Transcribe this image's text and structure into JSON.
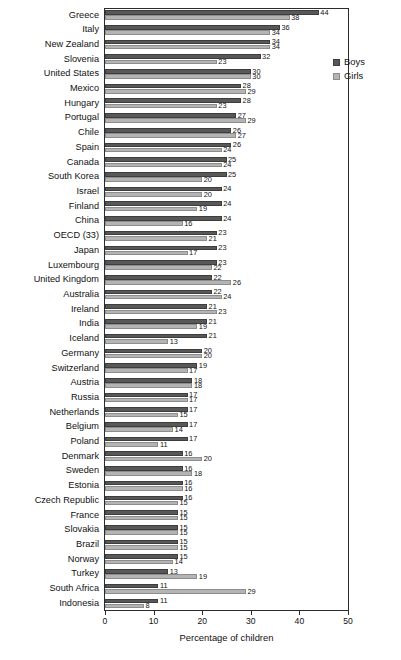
{
  "chart_data": {
    "type": "bar",
    "orientation": "horizontal",
    "title": "",
    "xlabel": "Percentage of children",
    "ylabel": "",
    "xlim": [
      0,
      50
    ],
    "xticks": [
      0,
      10,
      20,
      30,
      40,
      50
    ],
    "grid": false,
    "legend_position": "top-right",
    "categories": [
      "Greece",
      "Italy",
      "New Zealand",
      "Slovenia",
      "United States",
      "Mexico",
      "Hungary",
      "Portugal",
      "Chile",
      "Spain",
      "Canada",
      "South Korea",
      "Israel",
      "Finland",
      "China",
      "OECD (33)",
      "Japan",
      "Luxembourg",
      "United Kingdom",
      "Australia",
      "Ireland",
      "India",
      "Iceland",
      "Germany",
      "Switzerland",
      "Austria",
      "Russia",
      "Netherlands",
      "Belgium",
      "Poland",
      "Denmark",
      "Sweden",
      "Estonia",
      "Czech Republic",
      "France",
      "Slovakia",
      "Brazil",
      "Norway",
      "Turkey",
      "South Africa",
      "Indonesia"
    ],
    "series": [
      {
        "name": "Boys",
        "color": "#585858",
        "values": [
          44,
          36,
          34,
          32,
          30,
          28,
          28,
          27,
          26,
          26,
          25,
          25,
          24,
          24,
          24,
          23,
          23,
          23,
          22,
          22,
          21,
          21,
          21,
          20,
          19,
          18,
          17,
          17,
          17,
          17,
          16,
          16,
          16,
          16,
          15,
          15,
          15,
          15,
          13,
          11,
          11
        ]
      },
      {
        "name": "Girls",
        "color": "#b4b4b4",
        "values": [
          38,
          34,
          34,
          23,
          30,
          29,
          23,
          29,
          27,
          24,
          24,
          20,
          20,
          19,
          16,
          21,
          17,
          22,
          26,
          24,
          23,
          19,
          13,
          20,
          17,
          18,
          17,
          15,
          14,
          11,
          20,
          18,
          16,
          15,
          15,
          15,
          15,
          14,
          19,
          29,
          8
        ]
      }
    ]
  },
  "legend": {
    "items": [
      {
        "label": "Boys",
        "swatch": "boys-swatch"
      },
      {
        "label": "Girls",
        "swatch": "girls-swatch"
      }
    ]
  },
  "axis": {
    "x_title": "Percentage of children",
    "x_tick_labels": [
      "0",
      "10",
      "20",
      "30",
      "40",
      "50"
    ]
  }
}
